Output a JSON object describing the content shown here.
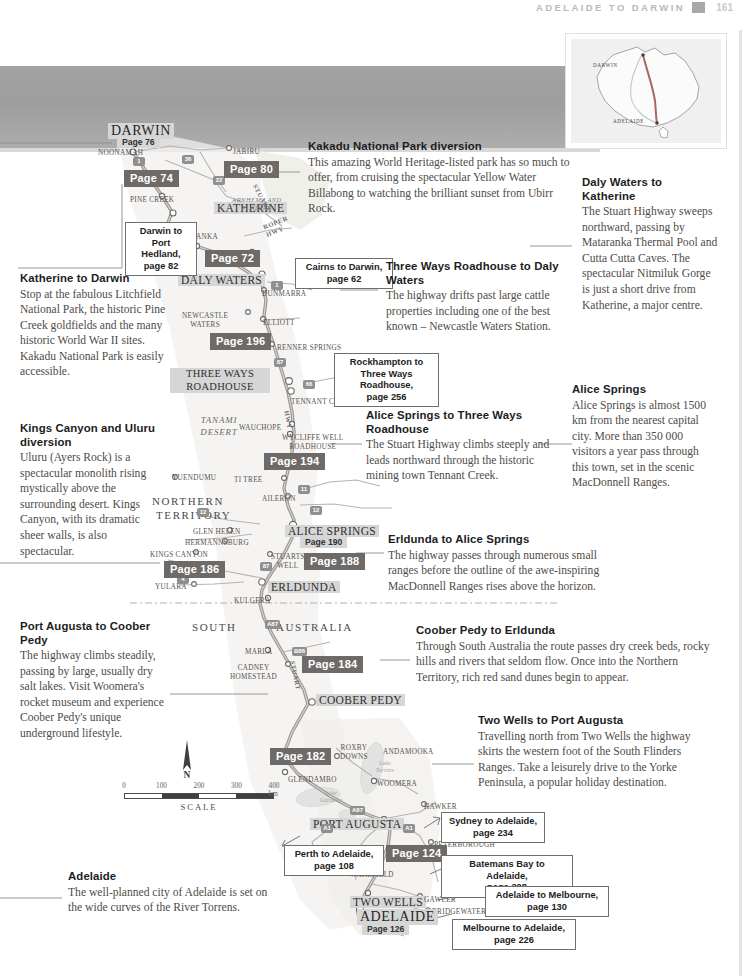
{
  "running_head": {
    "title": "Adelaide to Darwin",
    "page_number": "161"
  },
  "locator_map": {
    "darwin_label": "Darwin",
    "adelaide_label": "Adelaide"
  },
  "map": {
    "places": [
      {
        "name": "Darwin",
        "style": "city-lg",
        "x": 108,
        "y": 123
      },
      {
        "name": "Noonamah",
        "style": "town",
        "x": 98,
        "y": 149
      },
      {
        "name": "Jabiru",
        "style": "town",
        "x": 233,
        "y": 148
      },
      {
        "name": "Pine Creek",
        "style": "town",
        "x": 130,
        "y": 196
      },
      {
        "name": "Katherine",
        "style": "city",
        "x": 214,
        "y": 202
      },
      {
        "name": "Mataranka",
        "style": "town",
        "x": 170,
        "y": 233
      },
      {
        "name": "Larrimah",
        "style": "town",
        "x": 220,
        "y": 252
      },
      {
        "name": "Daly Waters",
        "style": "city",
        "x": 178,
        "y": 274
      },
      {
        "name": "Dunmarra",
        "style": "town",
        "x": 262,
        "y": 290
      },
      {
        "name": "Elliott",
        "style": "town",
        "x": 263,
        "y": 319
      },
      {
        "name": "Renner Springs",
        "style": "town",
        "x": 277,
        "y": 344
      },
      {
        "name": "Tennant Creek",
        "style": "town",
        "x": 291,
        "y": 398
      },
      {
        "name": "Wauchope",
        "style": "town",
        "x": 239,
        "y": 424
      },
      {
        "name": "Ti Tree",
        "style": "town",
        "x": 234,
        "y": 476
      },
      {
        "name": "Aileron",
        "style": "town",
        "x": 262,
        "y": 495
      },
      {
        "name": "Yuendumu",
        "style": "town",
        "x": 172,
        "y": 474
      },
      {
        "name": "Glen Helen",
        "style": "town",
        "x": 193,
        "y": 528
      },
      {
        "name": "Hermannsburg",
        "style": "town",
        "x": 185,
        "y": 539
      },
      {
        "name": "Kings Canyon",
        "style": "town",
        "x": 150,
        "y": 551
      },
      {
        "name": "Yulara",
        "style": "town",
        "x": 155,
        "y": 583
      },
      {
        "name": "Kulgera",
        "style": "town",
        "x": 234,
        "y": 597
      },
      {
        "name": "Alice Springs",
        "style": "city",
        "x": 285,
        "y": 525
      },
      {
        "name": "Erldunda",
        "style": "city",
        "x": 268,
        "y": 581
      },
      {
        "name": "Marla",
        "style": "town",
        "x": 245,
        "y": 648
      },
      {
        "name": "Coober Pedy",
        "style": "city",
        "x": 316,
        "y": 694
      },
      {
        "name": "Glendambo",
        "style": "town",
        "x": 288,
        "y": 776
      },
      {
        "name": "Woomera",
        "style": "town",
        "x": 377,
        "y": 780
      },
      {
        "name": "Andamooka",
        "style": "town",
        "x": 383,
        "y": 748
      },
      {
        "name": "Hawker",
        "style": "town",
        "x": 424,
        "y": 803
      },
      {
        "name": "Port Augusta",
        "style": "city",
        "x": 310,
        "y": 818
      },
      {
        "name": "Peterborough",
        "style": "town",
        "x": 434,
        "y": 841
      },
      {
        "name": "Two Wells",
        "style": "city",
        "x": 350,
        "y": 896
      },
      {
        "name": "Gawler",
        "style": "town",
        "x": 424,
        "y": 896
      },
      {
        "name": "Bridgewater",
        "style": "town",
        "x": 432,
        "y": 908
      },
      {
        "name": "Adelaide",
        "style": "city-lg",
        "x": 357,
        "y": 909
      }
    ],
    "multiline_places": [
      {
        "name": "Newcastle\nWaters",
        "x": 182,
        "y": 312
      },
      {
        "name": "Wycliffe Well\nRoadhouse",
        "x": 282,
        "y": 434
      },
      {
        "name": "Stuarts\nWell",
        "x": 271,
        "y": 553
      },
      {
        "name": "Cadney\nHomestead",
        "x": 230,
        "y": 664
      },
      {
        "name": "Roxby\nDowns",
        "x": 340,
        "y": 744
      },
      {
        "name": "Port\nWakefield",
        "x": 350,
        "y": 862
      }
    ],
    "roadhouse_label": "Three Ways\nRoadhouse",
    "regions": [
      {
        "name": "Northern",
        "x": 152,
        "y": 495
      },
      {
        "name": "Territory",
        "x": 156,
        "y": 509
      },
      {
        "name": "South",
        "x": 192,
        "y": 621
      },
      {
        "name": "Australia",
        "x": 276,
        "y": 621
      }
    ],
    "desert_label": "Tanami\nDesert",
    "plateau_label": "Arnhem Land\nPlateau",
    "lakes": [
      {
        "name": "Lake\nTorrens",
        "x": 368,
        "y": 760
      },
      {
        "name": "Lake\nGairdner",
        "x": 314,
        "y": 790
      }
    ],
    "highways": [
      {
        "name": "Stuart",
        "x": 258,
        "y": 183,
        "rot": 62
      },
      {
        "name": "Roper\nHwy",
        "x": 262,
        "y": 224,
        "rot": -22
      },
      {
        "name": "Hwy",
        "x": 290,
        "y": 410,
        "rot": 78
      },
      {
        "name": "Stuart",
        "x": 296,
        "y": 660,
        "rot": 78
      }
    ],
    "route_shields": [
      {
        "label": "1",
        "x": 133,
        "y": 157
      },
      {
        "label": "36",
        "x": 182,
        "y": 155
      },
      {
        "label": "22",
        "x": 213,
        "y": 176
      },
      {
        "label": "1",
        "x": 159,
        "y": 222
      },
      {
        "label": "1",
        "x": 271,
        "y": 281
      },
      {
        "label": "87",
        "x": 274,
        "y": 358
      },
      {
        "label": "66",
        "x": 303,
        "y": 380
      },
      {
        "label": "11",
        "x": 298,
        "y": 485
      },
      {
        "label": "12",
        "x": 197,
        "y": 508
      },
      {
        "label": "12",
        "x": 310,
        "y": 506
      },
      {
        "label": "4",
        "x": 177,
        "y": 575
      },
      {
        "label": "87",
        "x": 260,
        "y": 562
      },
      {
        "label": "A87",
        "x": 265,
        "y": 620
      },
      {
        "label": "B86",
        "x": 292,
        "y": 647
      },
      {
        "label": "A87",
        "x": 350,
        "y": 806
      },
      {
        "label": "A1",
        "x": 321,
        "y": 824
      },
      {
        "label": "A1",
        "x": 403,
        "y": 824
      },
      {
        "label": "A32",
        "x": 464,
        "y": 866
      }
    ],
    "page_chips": [
      {
        "label": "Page 74",
        "x": 124,
        "y": 170
      },
      {
        "label": "Page 80",
        "x": 224,
        "y": 161
      },
      {
        "label": "Page 72",
        "x": 205,
        "y": 250
      },
      {
        "label": "Page 196",
        "x": 210,
        "y": 333
      },
      {
        "label": "Page 194",
        "x": 264,
        "y": 453
      },
      {
        "label": "Page 188",
        "x": 304,
        "y": 553
      },
      {
        "label": "Page 186",
        "x": 164,
        "y": 561
      },
      {
        "label": "Page 184",
        "x": 302,
        "y": 656
      },
      {
        "label": "Page 182",
        "x": 270,
        "y": 748
      },
      {
        "label": "Page 124",
        "x": 386,
        "y": 845
      }
    ],
    "page_subs": [
      {
        "label": "Page 76",
        "x": 117,
        "y": 136
      },
      {
        "label": "Page 190",
        "x": 300,
        "y": 536
      },
      {
        "label": "Page 126",
        "x": 362,
        "y": 923
      }
    ],
    "xrefs": [
      {
        "label": "Darwin to\nPort Hedland,\npage 82",
        "x": 125,
        "y": 222,
        "w": 72
      },
      {
        "label": "Cairns to Darwin,\npage 62",
        "x": 295,
        "y": 258,
        "w": 98
      },
      {
        "label": "Rockhampton to\nThree Ways Roadhouse,\npage 256",
        "x": 334,
        "y": 353,
        "w": 105
      },
      {
        "label": "Sydney to Adelaide,\npage 234",
        "x": 441,
        "y": 812,
        "w": 104
      },
      {
        "label": "Perth to Adelaide,\npage 108",
        "x": 284,
        "y": 845,
        "w": 100
      },
      {
        "label": "Batemans Bay to Adelaide,\npage 208",
        "x": 441,
        "y": 855,
        "w": 132
      },
      {
        "label": "Adelaide to Melbourne,\npage 130",
        "x": 485,
        "y": 886,
        "w": 124
      },
      {
        "label": "Melbourne to Adelaide,\npage 226",
        "x": 452,
        "y": 919,
        "w": 124
      }
    ]
  },
  "scale": {
    "ticks": [
      "0",
      "100",
      "200",
      "300",
      "400 km"
    ],
    "caption": "Scale",
    "north_label": "N"
  },
  "blocks": [
    {
      "id": "katherine-to-darwin",
      "title": "Katherine to Darwin",
      "body": "Stop at the fabulous Litchfield National Park, the historic Pine Creek goldfields and the many historic World War II sites. Kakadu National Park is easily accessible.",
      "x": 20,
      "y": 272,
      "w": 148
    },
    {
      "id": "kings-canyon-and-uluru-diversion",
      "title": "Kings Canyon and Uluru diversion",
      "body": "Uluru (Ayers Rock) is a spectacular monolith rising mystically above the surrounding desert. Kings Canyon, with its dramatic sheer walls, is also spectacular.",
      "x": 20,
      "y": 422,
      "w": 140
    },
    {
      "id": "port-augusta-to-coober-pedy",
      "title": "Port Augusta to Coober Pedy",
      "body": "The highway climbs steadily, passing by large, usually dry salt lakes. Visit Woomera's rocket museum and experience Coober Pedy's unique underground lifestyle.",
      "x": 20,
      "y": 620,
      "w": 150
    },
    {
      "id": "adelaide",
      "title": "Adelaide",
      "body": "The well-planned city of Adelaide is set on the wide curves of the River Torrens.",
      "x": 68,
      "y": 870,
      "w": 208
    },
    {
      "id": "kakadu-national-park-diversion",
      "title": "Kakadu National Park diversion",
      "body": "This amazing World Heritage-listed park has so much to offer, from cruising the spectacular Yellow Water Billabong to watching the brilliant sunset from Ubirr Rock.",
      "x": 308,
      "y": 140,
      "w": 262
    },
    {
      "id": "daly-waters-to-katherine",
      "title": "Daly Waters to Katherine",
      "body": "The Stuart Highway sweeps northward, passing by Mataranka Thermal Pool and Cutta Cutta Caves. The spectacular Nitmiluk Gorge is just a short drive from Katherine, a major centre.",
      "x": 582,
      "y": 176,
      "w": 136
    },
    {
      "id": "three-ways-roadhouse-to-daly-waters",
      "title": "Three Ways Roadhouse to Daly Waters",
      "body": "The highway drifts past large cattle properties including one of the best known – Newcastle Waters Station.",
      "x": 386,
      "y": 260,
      "w": 184
    },
    {
      "id": "alice-springs",
      "title": "Alice Springs",
      "body": "Alice Springs is almost 1500 km from the nearest capital city. More than 350 000 visitors a year pass through this town, set in the scenic MacDonnell Ranges.",
      "x": 572,
      "y": 383,
      "w": 146
    },
    {
      "id": "alice-springs-to-three-ways-roadhouse",
      "title": "Alice Springs to Three Ways Roadhouse",
      "body": "The Stuart Highway climbs steeply and leads northward through the historic mining town Tennant Creek.",
      "x": 366,
      "y": 409,
      "w": 190
    },
    {
      "id": "erldunda-to-alice-springs",
      "title": "Erldunda to Alice Springs",
      "body": "The highway passes through numerous small ranges before the outline of the awe-inspiring MacDonnell Ranges rises above the horizon.",
      "x": 388,
      "y": 533,
      "w": 242
    },
    {
      "id": "coober-pedy-to-erldunda",
      "title": "Coober Pedy to Erldunda",
      "body": "Through South Australia the route passes dry creek beds, rocky hills and rivers that seldom flow. Once into the Northern Territory, rich red sand dunes begin to appear.",
      "x": 416,
      "y": 624,
      "w": 302
    },
    {
      "id": "two-wells-to-port-augusta",
      "title": "Two Wells to Port Augusta",
      "body": "Travelling north from Two Wells the highway skirts the western foot of the South Flinders Ranges. Take a leisurely drive to the Yorke Peninsula, a popular holiday destination.",
      "x": 478,
      "y": 714,
      "w": 240
    }
  ],
  "colors": {
    "chip_background": "#6d6a68",
    "highlight_background": "#d6d6d6",
    "route_line": "#8a8a8a",
    "land": "#f4f1ee"
  }
}
